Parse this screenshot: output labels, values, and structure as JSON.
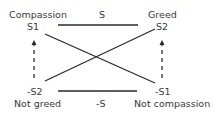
{
  "nodes": {
    "top_left": {
      "name": "Compassion",
      "symbol": "S1"
    },
    "top_right": {
      "name": "Greed",
      "symbol": "S2"
    },
    "bottom_left": {
      "name": "Not greed",
      "symbol": "-S2"
    },
    "bottom_right": {
      "name": "Not compassion",
      "symbol": "-S1"
    }
  },
  "edges": {
    "top": "S",
    "bottom": "-S"
  },
  "colors": {
    "line": "#2a2a2a",
    "text": "#3a3a3a"
  }
}
